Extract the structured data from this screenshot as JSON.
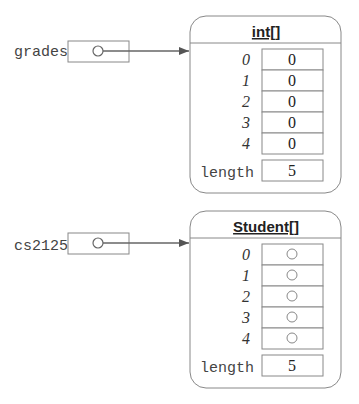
{
  "variables": [
    {
      "name": "grades",
      "points_to": "int[]"
    },
    {
      "name": "cs2125",
      "points_to": "Student[]"
    }
  ],
  "objects": [
    {
      "type": "int[]",
      "indices": [
        "0",
        "1",
        "2",
        "3",
        "4"
      ],
      "values": [
        "0",
        "0",
        "0",
        "0",
        "0"
      ],
      "length_label": "length",
      "length": "5"
    },
    {
      "type": "Student[]",
      "indices": [
        "0",
        "1",
        "2",
        "3",
        "4"
      ],
      "values": [
        "null-ref",
        "null-ref",
        "null-ref",
        "null-ref",
        "null-ref"
      ],
      "length_label": "length",
      "length": "5"
    }
  ],
  "colors": {
    "stroke": "#777777",
    "arrow": "#555555",
    "text": "#222222"
  }
}
